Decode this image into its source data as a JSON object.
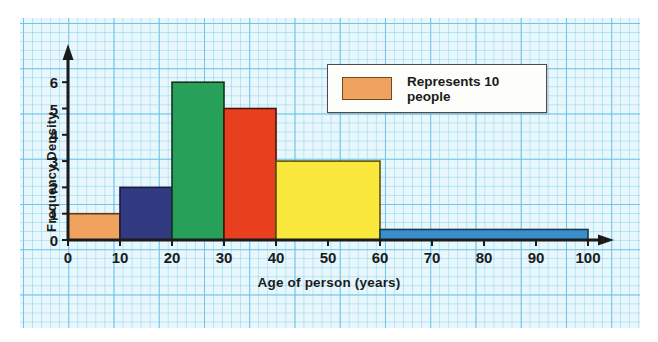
{
  "chart_data": {
    "type": "bar",
    "title": "",
    "xlabel": "Age of person (years)",
    "ylabel": "Frequency Density",
    "xlim": [
      0,
      100
    ],
    "ylim": [
      0,
      6.5
    ],
    "grid": true,
    "legend_position": "top-right",
    "xticks": [
      "0",
      "10",
      "20",
      "30",
      "40",
      "50",
      "60",
      "70",
      "80",
      "90",
      "100"
    ],
    "yticks": [
      "0",
      "1",
      "2",
      "3",
      "4",
      "5",
      "6"
    ],
    "categories": [
      "0-10",
      "10-20",
      "20-30",
      "30-40",
      "40-60",
      "60-100"
    ],
    "values": [
      1,
      2,
      6,
      5,
      3,
      0.4
    ],
    "bins": [
      {
        "label": "0-10",
        "start": 0,
        "end": 10,
        "value": 1,
        "color": "#F0A35E"
      },
      {
        "label": "10-20",
        "start": 10,
        "end": 20,
        "value": 2,
        "color": "#323B82"
      },
      {
        "label": "20-30",
        "start": 20,
        "end": 30,
        "value": 6,
        "color": "#27A05A"
      },
      {
        "label": "30-40",
        "start": 30,
        "end": 40,
        "value": 5,
        "color": "#E8401F"
      },
      {
        "label": "40-60",
        "start": 40,
        "end": 60,
        "value": 3,
        "color": "#FAE83C"
      },
      {
        "label": "60-100",
        "start": 60,
        "end": 100,
        "value": 0.4,
        "color": "#3A8ECC"
      }
    ],
    "legend": [
      {
        "label": "Represents 10 people",
        "color": "#F0A35E"
      }
    ],
    "annotations": []
  },
  "legend": {
    "text": "Represents 10 people",
    "swatch_color": "#F0A35E"
  },
  "axes": {
    "x_title": "Age of person (years)",
    "y_title": "Frequency Density",
    "x_ticks": [
      "0",
      "10",
      "20",
      "30",
      "40",
      "50",
      "60",
      "70",
      "80",
      "90",
      "100"
    ],
    "y_ticks": [
      "0",
      "1",
      "2",
      "3",
      "4",
      "5",
      "6"
    ]
  },
  "colors": {
    "paper": "#e8f7fc",
    "grid_minor": "#78c8e8",
    "grid_major": "#46afe1",
    "axis": "#1b1b1b",
    "bar_outline": "#2b2b2b"
  }
}
